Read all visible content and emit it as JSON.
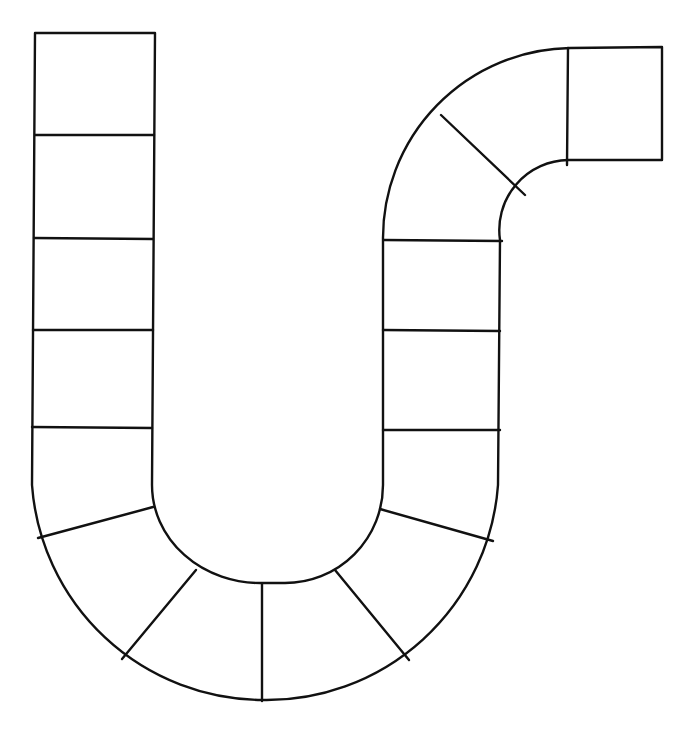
{
  "board": {
    "title": "Blank game board path",
    "stroke_color": "#111111",
    "background": "#ffffff",
    "space_count": 17,
    "sections": [
      {
        "name": "left-column",
        "spaces": 5
      },
      {
        "name": "bottom-u-curve",
        "spaces": 6
      },
      {
        "name": "right-column",
        "spaces": 3
      },
      {
        "name": "top-right-curve",
        "spaces": 2
      },
      {
        "name": "end-square",
        "spaces": 1
      }
    ]
  }
}
